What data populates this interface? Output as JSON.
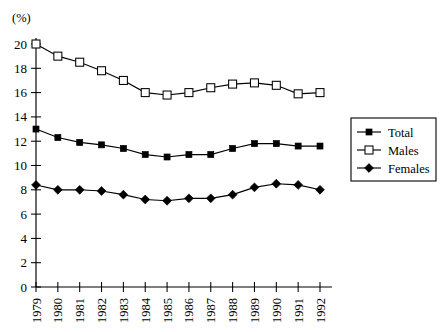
{
  "chart_data": {
    "type": "line",
    "title": "",
    "xlabel": "",
    "ylabel": "(%)",
    "unit_label": "(%)",
    "categories": [
      "1979",
      "1980",
      "1981",
      "1982",
      "1983",
      "1984",
      "1985",
      "1986",
      "1987",
      "1988",
      "1989",
      "1990",
      "1991",
      "1992"
    ],
    "x": [
      1979,
      1980,
      1981,
      1982,
      1983,
      1984,
      1985,
      1986,
      1987,
      1988,
      1989,
      1990,
      1991,
      1992
    ],
    "ylim": [
      0,
      20
    ],
    "xlim": [
      1979,
      1992
    ],
    "yticks": [
      0,
      2,
      4,
      6,
      8,
      10,
      12,
      14,
      16,
      18,
      20
    ],
    "ytick_labels": [
      "0",
      "2",
      "4",
      "6",
      "8",
      "10",
      "12",
      "14",
      "16",
      "18",
      "20"
    ],
    "grid": false,
    "legend_position": "right",
    "series": [
      {
        "name": "Total",
        "marker": "filled-square",
        "color": "#000000",
        "values": [
          13.0,
          12.3,
          11.9,
          11.7,
          11.4,
          10.9,
          10.7,
          10.9,
          10.9,
          11.4,
          11.8,
          11.8,
          11.6,
          11.6
        ]
      },
      {
        "name": "Males",
        "marker": "open-square",
        "color": "#000000",
        "values": [
          20.0,
          19.0,
          18.5,
          17.8,
          17.0,
          16.0,
          15.8,
          16.0,
          16.4,
          16.7,
          16.8,
          16.6,
          15.9,
          16.0
        ]
      },
      {
        "name": "Females",
        "marker": "filled-diamond",
        "color": "#000000",
        "values": [
          8.4,
          8.0,
          8.0,
          7.9,
          7.6,
          7.2,
          7.1,
          7.3,
          7.3,
          7.6,
          8.2,
          8.5,
          8.4,
          8.0
        ]
      }
    ],
    "legend": [
      {
        "label": "Total",
        "marker": "filled-square"
      },
      {
        "label": "Males",
        "marker": "open-square"
      },
      {
        "label": "Females",
        "marker": "filled-diamond"
      }
    ]
  }
}
